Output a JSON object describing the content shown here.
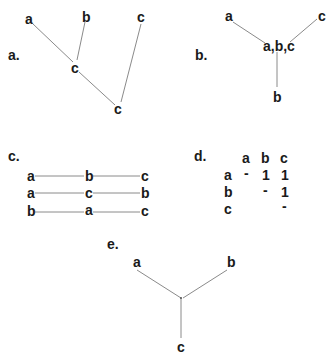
{
  "panels": {
    "a": {
      "label": "a.",
      "nodes": [
        {
          "id": "n1",
          "text": "a"
        },
        {
          "id": "n2",
          "text": "b"
        },
        {
          "id": "n3",
          "text": "c"
        },
        {
          "id": "n4",
          "text": "c"
        },
        {
          "id": "n5",
          "text": "c"
        }
      ]
    },
    "b": {
      "label": "b.",
      "nodes": [
        {
          "id": "n1",
          "text": "a"
        },
        {
          "id": "n2",
          "text": "c"
        },
        {
          "id": "n3",
          "text": "a,b,c"
        },
        {
          "id": "n4",
          "text": "b"
        }
      ]
    },
    "c": {
      "label": "c.",
      "rows": [
        [
          "a",
          "b",
          "c"
        ],
        [
          "a",
          "c",
          "b"
        ],
        [
          "b",
          "a",
          "c"
        ]
      ]
    },
    "d": {
      "label": "d.",
      "col_headers": [
        "a",
        "b",
        "c"
      ],
      "row_headers": [
        "a",
        "b",
        "c"
      ],
      "cells": [
        [
          "-",
          "1",
          "1"
        ],
        [
          "",
          "-",
          "1"
        ],
        [
          "",
          "",
          "-"
        ]
      ]
    },
    "e": {
      "label": "e.",
      "nodes": [
        {
          "id": "n1",
          "text": "a"
        },
        {
          "id": "n2",
          "text": "b"
        },
        {
          "id": "n3",
          "text": "c"
        }
      ]
    }
  }
}
